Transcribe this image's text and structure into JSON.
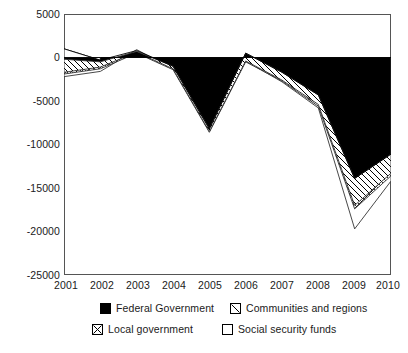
{
  "chart_data": {
    "type": "area",
    "title": "",
    "subtitle": "",
    "xlabel": "",
    "ylabel": "",
    "categories": [
      "2001",
      "2002",
      "2003",
      "2004",
      "2005",
      "2006",
      "2007",
      "2008",
      "2009",
      "2010"
    ],
    "x": [
      2001,
      2002,
      2003,
      2004,
      2005,
      2006,
      2007,
      2008,
      2009,
      2010
    ],
    "ylim": [
      -25000,
      5000
    ],
    "xlim": [
      2001,
      2010
    ],
    "ytick_labels": [
      "5000",
      "0",
      "-5000",
      "-10000",
      "-15000",
      "-20000",
      "-25000"
    ],
    "ytick_values": [
      5000,
      0,
      -5000,
      -10000,
      -15000,
      -20000,
      -25000
    ],
    "xtick_labels": [
      "2001",
      "2002",
      "2003",
      "2004",
      "2005",
      "2006",
      "2007",
      "2008",
      "2009",
      "2010"
    ],
    "grid": false,
    "stacked": true,
    "legend_position": "bottom",
    "series": [
      {
        "name": "Federal Government",
        "pattern": "solid-black",
        "color": "#000000",
        "values": [
          -200,
          -500,
          700,
          -1000,
          -8200,
          500,
          -1700,
          -4300,
          -13900,
          -11100
        ],
        "cumulative": [
          -200,
          -500,
          700,
          -1000,
          -8200,
          500,
          -1700,
          -4300,
          -13900,
          -11100
        ]
      },
      {
        "name": "Communities and regions",
        "pattern": "diagonal-hatch",
        "color": "#000000",
        "values": [
          -1500,
          -600,
          -100,
          -300,
          -300,
          -900,
          -900,
          -1100,
          -3100,
          -2200
        ],
        "cumulative": [
          -1700,
          -1100,
          600,
          -1300,
          -8500,
          -400,
          -2600,
          -5400,
          -17000,
          -13300
        ]
      },
      {
        "name": "Local government",
        "pattern": "cross-hatch",
        "color": "#000000",
        "values": [
          -200,
          -200,
          -100,
          -100,
          -100,
          -100,
          -100,
          -200,
          -400,
          -300
        ],
        "cumulative": [
          -1900,
          -1300,
          500,
          -1400,
          -8600,
          -500,
          -2700,
          -5600,
          -17400,
          -13600
        ]
      },
      {
        "name": "Social security funds",
        "pattern": "white",
        "color": "#ffffff",
        "values": [
          -300,
          -300,
          400,
          100,
          100,
          100,
          -100,
          -200,
          -2300,
          -600
        ],
        "cumulative": [
          -2200,
          -1600,
          900,
          -1300,
          -8500,
          -400,
          -2800,
          -5800,
          -19700,
          -14200
        ]
      }
    ],
    "top_line": {
      "name": "zero-reference-and-top-outline",
      "values": [
        1000,
        -300,
        800,
        -1000,
        -8200,
        500,
        -1700,
        -4300,
        -13900,
        -11100
      ]
    },
    "legend": [
      {
        "label": "Federal Government",
        "swatch": "solid-black"
      },
      {
        "label": "Communities and regions",
        "swatch": "diagonal-hatch"
      },
      {
        "label": "Local government",
        "swatch": "cross-hatch"
      },
      {
        "label": "Social security funds",
        "swatch": "white"
      }
    ]
  }
}
